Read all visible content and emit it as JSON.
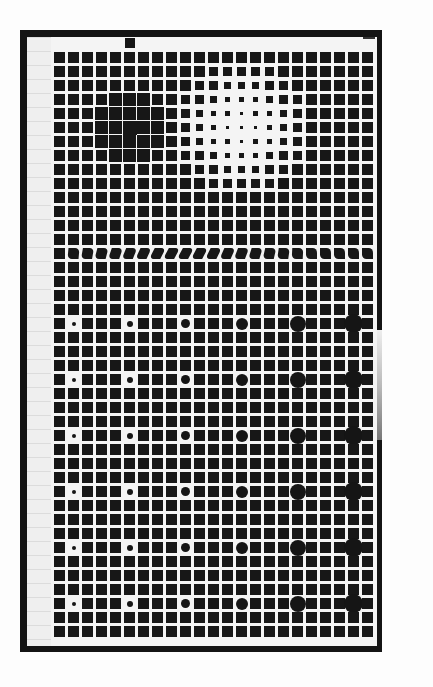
{
  "title": "",
  "figure": {
    "grid": {
      "cols": 23,
      "rows": 42,
      "pitch_px": 14,
      "square_px": 11,
      "origin": [
        54,
        52
      ]
    },
    "colors": {
      "ink": "#171717",
      "paper": "#f4f4f4",
      "frame": "#141414"
    },
    "dark_blob": {
      "center_col": 5,
      "center_row": 5,
      "radius": 4
    },
    "light_blob": {
      "center_col": 13,
      "center_row": 5,
      "radius": 5
    },
    "skew_row": 14,
    "dot_rows": [
      19,
      23,
      27,
      31,
      35,
      39
    ],
    "dot_cols": [
      1,
      5,
      9,
      13,
      17,
      21
    ],
    "dot_diameters": [
      4,
      6,
      9,
      12,
      16,
      19
    ]
  }
}
